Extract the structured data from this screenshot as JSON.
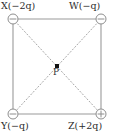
{
  "figure": {
    "type": "physics-charge-square-diagram",
    "colors": {
      "edge_line": "#9a9a9a",
      "diagonal_line": "#a8a8a8",
      "charge_outline": "#8e8e8e",
      "charge_sign": "#8e8e8e",
      "point_marker": "#111111",
      "text": "#2b2b2b",
      "background": "#ffffff"
    },
    "square": {
      "left": 13,
      "top": 19,
      "right": 101,
      "bottom": 114,
      "edge_style": "solid",
      "diagonal_style": "dotted"
    },
    "charges": [
      {
        "id": "X",
        "position": "top-left",
        "label": "X(−2q)",
        "sign": "−",
        "sign_glyph": "minus",
        "magnitude": "2q",
        "cx": 13,
        "cy": 19,
        "r": 5
      },
      {
        "id": "W",
        "position": "top-right",
        "label": "W(−q)",
        "sign": "−",
        "sign_glyph": "minus",
        "magnitude": "q",
        "cx": 101,
        "cy": 19,
        "r": 5
      },
      {
        "id": "Y",
        "position": "bottom-left",
        "label": "Y(−q)",
        "sign": "−",
        "sign_glyph": "minus",
        "magnitude": "q",
        "cx": 13,
        "cy": 114,
        "r": 5
      },
      {
        "id": "Z",
        "position": "bottom-right",
        "label": "Z(+2q)",
        "sign": "+",
        "sign_glyph": "plus",
        "magnitude": "2q",
        "cx": 101,
        "cy": 114,
        "r": 5
      }
    ],
    "center_point": {
      "label": "P",
      "cx": 57,
      "cy": 66,
      "marker": "filled-square",
      "marker_size": 4
    }
  }
}
